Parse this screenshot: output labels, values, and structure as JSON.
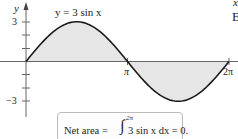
{
  "chart_data": {
    "type": "area",
    "title": "",
    "function_label": "y = 3 sin x",
    "xlabel": "x",
    "ylabel": "y",
    "x_ticks": [
      {
        "value": 3.14159,
        "label": "π"
      },
      {
        "value": 6.28318,
        "label": "2π"
      }
    ],
    "y_ticks": [
      {
        "value": 3,
        "label": "3"
      },
      {
        "value": 2,
        "label": ""
      },
      {
        "value": 1,
        "label": ""
      },
      {
        "value": -1,
        "label": ""
      },
      {
        "value": -2,
        "label": ""
      },
      {
        "value": -3,
        "label": "−3"
      }
    ],
    "xlim": [
      0,
      6.28318
    ],
    "ylim": [
      -3,
      3
    ],
    "grid": false,
    "series": [
      {
        "name": "y = 3 sin x",
        "x": [
          0,
          0.785,
          1.571,
          2.356,
          3.142,
          3.927,
          4.712,
          5.498,
          6.283
        ],
        "values": [
          0,
          2.12,
          3,
          2.12,
          0,
          -2.12,
          -3,
          -2.12,
          0
        ],
        "fill": "#e6e6e6",
        "stroke": "#1a1a1a"
      }
    ],
    "annotations": [
      "Net area = ∫₀^{2π} 3 sin x dx = 0."
    ]
  },
  "labels": {
    "y_axis": "y",
    "func": "y = 3 sin x",
    "tick_3": "3",
    "tick_m3": "−3",
    "tick_pi": "π",
    "tick_2pi": "2π",
    "corner_x": "x",
    "corner_e": "E"
  },
  "formula": {
    "prefix": "Net area = ",
    "integral": "∫",
    "upper": "2π",
    "lower": "0",
    "body": "3 sin x dx = 0."
  },
  "colors": {
    "fill": "#e6e6e6",
    "curve": "#1a1a1a",
    "axis": "#555555"
  }
}
